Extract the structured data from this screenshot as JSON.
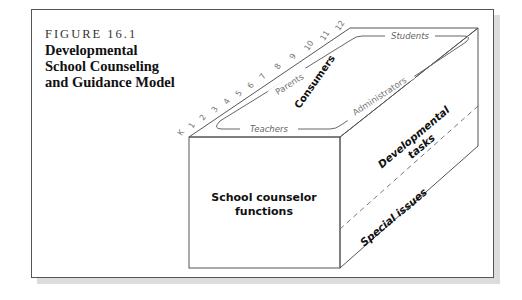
{
  "figure": {
    "label": "FIGURE 16.1",
    "title_lines": [
      "Developmental",
      "School Counseling",
      "and Guidance Model"
    ]
  },
  "cube": {
    "front_face_label_lines": [
      "School counselor",
      "functions"
    ],
    "right_face": {
      "upper_label_lines": [
        "Developmental",
        "tasks"
      ],
      "lower_label": "Special issues"
    },
    "top_face": {
      "center_label": "Consumers",
      "edge_labels": {
        "left": "Parents",
        "bottom": "Teachers",
        "top": "Students",
        "right": "Administrators"
      }
    },
    "grade_scale": [
      "K",
      "1",
      "2",
      "3",
      "4",
      "5",
      "6",
      "7",
      "8",
      "9",
      "10",
      "11",
      "12"
    ]
  },
  "colors": {
    "line": "#555555",
    "text": "#111111",
    "light_text": "#666666",
    "shadow": "#dcdcdc"
  }
}
